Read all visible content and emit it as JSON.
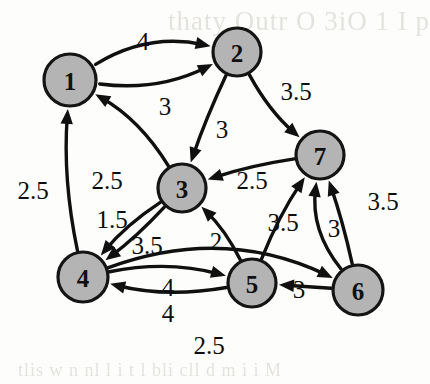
{
  "figure": {
    "background_color": "#fdfdfb",
    "node_fill_color": "#b4b4b4",
    "node_stroke_color": "#141414",
    "edge_color": "#101010"
  },
  "bleed_text": {
    "top": "thaty Outr O 3iO  1  I p",
    "bottom": "tlis w n nl l i t l bli cll  d m i  i   M"
  },
  "chart_data": {
    "type": "diagram",
    "subtype": "directed-weighted-graph",
    "title": "",
    "nodes": [
      {
        "id": "1",
        "label": "1",
        "x": 70,
        "y": 80,
        "r": 26
      },
      {
        "id": "2",
        "label": "2",
        "x": 237,
        "y": 52,
        "r": 24
      },
      {
        "id": "3",
        "label": "3",
        "x": 182,
        "y": 188,
        "r": 24
      },
      {
        "id": "4",
        "label": "4",
        "x": 83,
        "y": 277,
        "r": 25
      },
      {
        "id": "5",
        "label": "5",
        "x": 252,
        "y": 283,
        "r": 24
      },
      {
        "id": "6",
        "label": "6",
        "x": 358,
        "y": 290,
        "r": 25
      },
      {
        "id": "7",
        "label": "7",
        "x": 320,
        "y": 155,
        "r": 24
      }
    ],
    "edges": [
      {
        "from": "1",
        "to": "2",
        "weight": "4",
        "label_x": 143,
        "label_y": 41
      },
      {
        "from": "1",
        "to": "2",
        "weight": "3",
        "label_x": 165,
        "label_y": 106
      },
      {
        "from": "2",
        "to": "3",
        "weight": "3",
        "label_x": 222,
        "label_y": 129
      },
      {
        "from": "2",
        "to": "7",
        "weight": "3.5",
        "label_x": 296,
        "label_y": 91
      },
      {
        "from": "7",
        "to": "3",
        "weight": "2.5",
        "label_x": 252,
        "label_y": 180
      },
      {
        "from": "6",
        "to": "7",
        "weight": "3.5",
        "label_x": 383,
        "label_y": 201
      },
      {
        "from": "5",
        "to": "7",
        "weight": "3.5",
        "label_x": 283,
        "label_y": 222
      },
      {
        "from": "6",
        "to": "7",
        "weight": "3",
        "label_x": 334,
        "label_y": 228
      },
      {
        "from": "3",
        "to": "1",
        "weight": "2.5",
        "label_x": 107,
        "label_y": 180
      },
      {
        "from": "4",
        "to": "1",
        "weight": "2.5",
        "label_x": 33,
        "label_y": 190
      },
      {
        "from": "3",
        "to": "4",
        "weight": "1.5",
        "label_x": 112,
        "label_y": 219
      },
      {
        "from": "3",
        "to": "4",
        "weight": "3.5",
        "label_x": 147,
        "label_y": 245
      },
      {
        "from": "5",
        "to": "3",
        "weight": "2",
        "label_x": 216,
        "label_y": 241
      },
      {
        "from": "5",
        "to": "4",
        "weight": "4",
        "label_x": 168,
        "label_y": 287
      },
      {
        "from": "4",
        "to": "5",
        "weight": "4",
        "label_x": 168,
        "label_y": 313
      },
      {
        "from": "6",
        "to": "5",
        "weight": "3",
        "label_x": 299,
        "label_y": 289
      },
      {
        "from": "4",
        "to": "6",
        "weight": "2.5",
        "label_x": 209,
        "label_y": 345
      }
    ],
    "node_count": 7,
    "edge_count": 17,
    "directed": true,
    "weighted": true
  }
}
